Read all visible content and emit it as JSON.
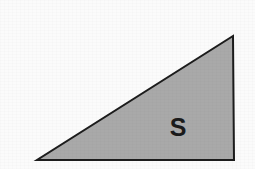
{
  "figure": {
    "canvas": {
      "width": 255,
      "height": 169,
      "background_color": "#fbfbfb"
    },
    "shape": {
      "kind": "right-triangle",
      "fill_color": "#a9a9a9",
      "stroke_color": "#1c1c1c",
      "stroke_width": 2,
      "vertices": [
        {
          "name": "bottom-left",
          "x": 37,
          "y": 160
        },
        {
          "name": "bottom-right",
          "x": 234,
          "y": 160
        },
        {
          "name": "apex-top-right",
          "x": 233,
          "y": 36
        }
      ],
      "points_attr": "37,160 234,160 233,36"
    },
    "label": {
      "text": "S",
      "x": 178,
      "y": 127,
      "color": "#1a1a1a",
      "font_size": "25px",
      "font_weight": "bold"
    }
  }
}
